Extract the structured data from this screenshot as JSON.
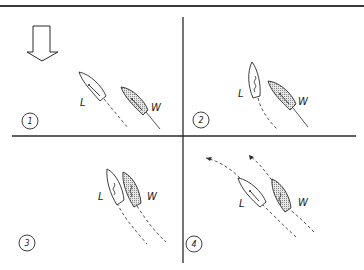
{
  "diagram": {
    "wind_indicator": "hollow-down-arrow",
    "colors": {
      "ink": "#2a2a2a",
      "hull_fill_windward": "#cfcfcf",
      "hull_fill_leeward": "#ffffff",
      "background": "#ffffff"
    },
    "panels": [
      {
        "number": "1",
        "boats": [
          {
            "label": "L",
            "role": "leeward",
            "shaded": false
          },
          {
            "label": "W",
            "role": "windward",
            "shaded": true
          }
        ]
      },
      {
        "number": "2",
        "boats": [
          {
            "label": "L",
            "role": "leeward",
            "shaded": false
          },
          {
            "label": "W",
            "role": "windward",
            "shaded": true
          }
        ]
      },
      {
        "number": "3",
        "boats": [
          {
            "label": "L",
            "role": "leeward",
            "shaded": false
          },
          {
            "label": "W",
            "role": "windward",
            "shaded": true
          }
        ]
      },
      {
        "number": "4",
        "boats": [
          {
            "label": "L",
            "role": "leeward",
            "shaded": false
          },
          {
            "label": "W",
            "role": "windward",
            "shaded": true
          }
        ]
      }
    ]
  }
}
